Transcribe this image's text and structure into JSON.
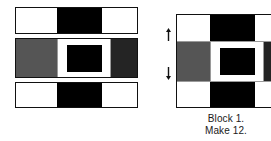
{
  "diagram": {
    "type": "quilt-block-piecing-diagram",
    "caption": {
      "line1": "Block 1.",
      "line2": "Make 12."
    },
    "colors": {
      "white": "#ffffff",
      "black": "#000000",
      "medium_gray": "#555555",
      "dark_gray": "#242424",
      "outline": "#111111",
      "background": "#ffffff",
      "text": "#1a1a1a"
    },
    "left_panel": {
      "label": "strip-units",
      "rows": [
        {
          "name": "top-row-unit",
          "segments": [
            {
              "name": "white-square-left",
              "fill": "white"
            },
            {
              "name": "black-rectangle-center",
              "fill": "black"
            },
            {
              "name": "white-square-right",
              "fill": "white"
            }
          ]
        },
        {
          "name": "middle-row-unit",
          "segments": [
            {
              "name": "gray-square-left",
              "fill": "medium_gray"
            },
            {
              "name": "white-sashing-left",
              "fill": "white"
            },
            {
              "name": "center-square-in-square",
              "fill": "black"
            },
            {
              "name": "white-sashing-right",
              "fill": "white"
            },
            {
              "name": "dark-gray-square-right",
              "fill": "dark_gray"
            }
          ]
        },
        {
          "name": "bottom-row-unit",
          "segments": [
            {
              "name": "white-square-left",
              "fill": "white"
            },
            {
              "name": "black-rectangle-center",
              "fill": "black"
            },
            {
              "name": "white-square-right",
              "fill": "white"
            }
          ]
        }
      ]
    },
    "right_panel": {
      "label": "assembled-block",
      "cropped_at_right_edge": true,
      "grid": [
        [
          {
            "name": "cell-top-left",
            "fill": "white"
          },
          {
            "name": "cell-top-center",
            "fill": "black"
          },
          {
            "name": "cell-top-right",
            "fill": "white"
          }
        ],
        [
          {
            "name": "cell-middle-left",
            "fill": "medium_gray"
          },
          {
            "name": "cell-middle-center",
            "fill": "black"
          },
          {
            "name": "cell-middle-right",
            "fill": "dark_gray"
          }
        ],
        [
          {
            "name": "cell-bottom-left",
            "fill": "white"
          },
          {
            "name": "cell-bottom-center",
            "fill": "black"
          },
          {
            "name": "cell-bottom-right",
            "fill": "white"
          }
        ]
      ],
      "seam_markers": [
        {
          "name": "seam-arrow-upper",
          "direction": "up"
        },
        {
          "name": "seam-arrow-lower",
          "direction": "down"
        }
      ]
    }
  }
}
